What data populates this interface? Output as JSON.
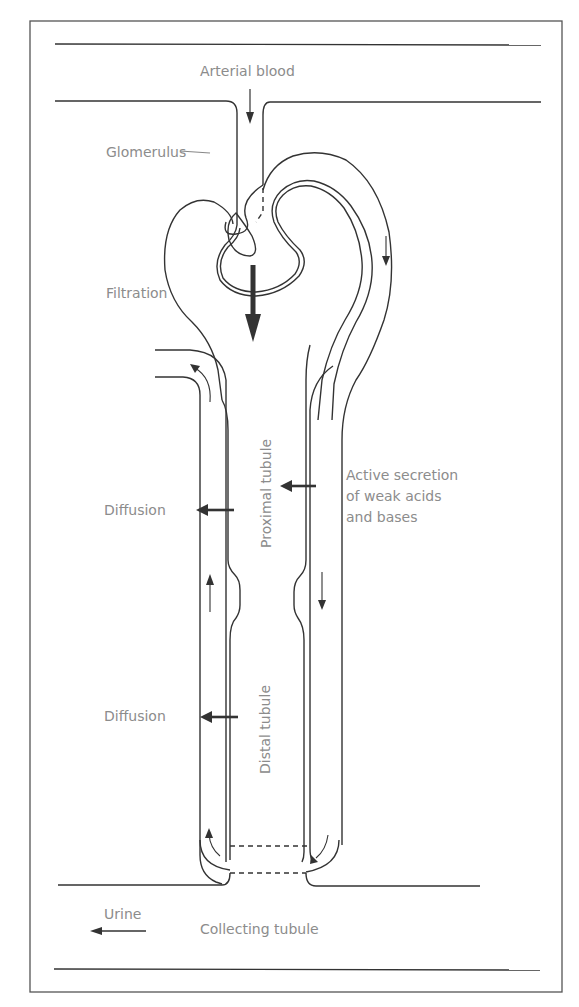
{
  "diagram": {
    "labels": {
      "arterial_blood": "Arterial blood",
      "glomerulus": "Glomerulus",
      "filtration": "Filtration",
      "proximal_tubule": "Proximal tubule",
      "active_secretion_line1": "Active secretion",
      "active_secretion_line2": "of weak acids",
      "active_secretion_line3": "and bases",
      "diffusion_upper": "Diffusion",
      "diffusion_lower": "Diffusion",
      "distal_tubule": "Distal tubule",
      "urine": "Urine",
      "collecting_tubule": "Collecting tubule"
    },
    "colors": {
      "line": "#333333",
      "label_text": "#8c8c8c",
      "frame": "#555555",
      "background": "#ffffff"
    },
    "icons": {
      "arterial_arrow": "arrow-down-icon",
      "filtration_arrow": "thick-arrow-down-icon",
      "secretion_arrow": "arrow-left-icon",
      "diffusion_arrows": "arrow-left-icon",
      "urine_arrow": "arrow-left-icon",
      "flow_arrows": "flow-direction-arrow-icon"
    }
  }
}
